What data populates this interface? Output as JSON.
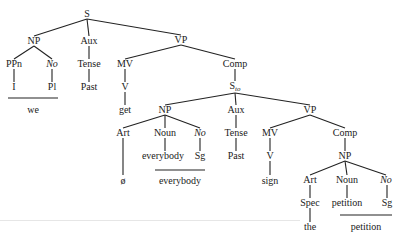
{
  "diagram": {
    "type": "syntax-tree",
    "sentence_words": [
      "we",
      "everybody",
      "petition"
    ],
    "nodes": {
      "s": "S",
      "np1": "NP",
      "aux1": "Aux",
      "vp1": "VP",
      "ppn": "PPn",
      "no1": "No",
      "tense1": "Tense",
      "i": "I",
      "pl": "Pl",
      "past1": "Past",
      "we": "we",
      "mv1": "MV",
      "v1": "V",
      "get": "get",
      "comp1": "Comp",
      "sto_main": "S",
      "sto_sub": "to",
      "np2": "NP",
      "aux2": "Aux",
      "vp2": "VP",
      "art1": "Art",
      "noun1": "Noun",
      "no2": "No",
      "everybody1": "everybody",
      "sg1": "Sg",
      "null": "ø",
      "everybody2": "everybody",
      "tense2": "Tense",
      "past2": "Past",
      "mv2": "MV",
      "v2": "V",
      "sign": "sign",
      "comp2": "Comp",
      "np3": "NP",
      "art2": "Art",
      "noun2": "Noun",
      "no3": "No",
      "spec": "Spec",
      "petition1": "petition",
      "sg2": "Sg",
      "the": "the",
      "petition2": "petition"
    }
  }
}
